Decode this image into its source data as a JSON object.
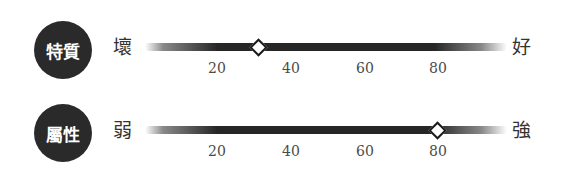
{
  "scales": [
    {
      "category": "特質",
      "left_label": "壞",
      "right_label": "好",
      "value": 31,
      "ticks": [
        "20",
        "40",
        "60",
        "80"
      ]
    },
    {
      "category": "屬性",
      "left_label": "弱",
      "right_label": "強",
      "value": 80,
      "ticks": [
        "20",
        "40",
        "60",
        "80"
      ]
    }
  ],
  "colors": {
    "badge": "#2a2a2a",
    "track": "#262626",
    "marker_fill": "#ffffff",
    "marker_border": "#1a1a1a",
    "tick_text": "#4a4a4a"
  },
  "scale_range": [
    0,
    100
  ]
}
